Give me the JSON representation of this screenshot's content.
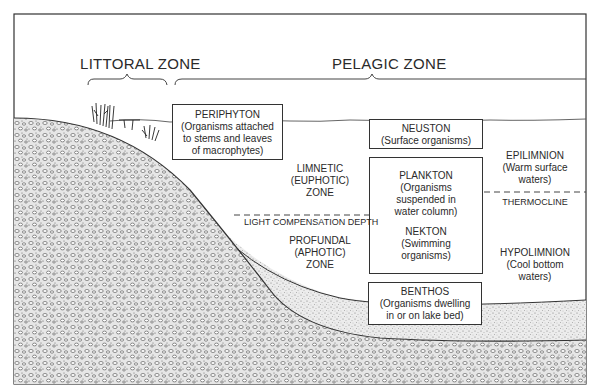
{
  "diagram": {
    "type": "lake zonation cross-section",
    "zones": {
      "littoral": "LITTORAL ZONE",
      "pelagic": "PELAGIC ZONE"
    },
    "boxes": {
      "periphyton": {
        "title": "PERIPHYTON",
        "lines": [
          "(Organisms attached",
          "to stems and leaves",
          "of macrophytes)"
        ]
      },
      "neuston": {
        "title": "NEUSTON",
        "lines": [
          "(Surface organisms)"
        ]
      },
      "plankton": {
        "title": "PLANKTON",
        "lines": [
          "(Organisms",
          "suspended in",
          "water column)"
        ]
      },
      "nekton": {
        "title": "NEKTON",
        "lines": [
          "(Swimming",
          "organisms)"
        ]
      },
      "benthos": {
        "title": "BENTHOS",
        "lines": [
          "(Organisms dwelling",
          "in or on lake bed)"
        ]
      }
    },
    "labels": {
      "limnetic": [
        "LIMNETIC",
        "(EUPHOTIC)",
        "ZONE"
      ],
      "light_compensation": "LIGHT COMPENSATION DEPTH",
      "profundal": [
        "PROFUNDAL",
        "(APHOTIC)",
        "ZONE"
      ],
      "epilimnion": [
        "EPILIMNION",
        "(Warm surface",
        "waters)"
      ],
      "thermocline": "THERMOCLINE",
      "hypolimnion": [
        "HYPOLIMNION",
        "(Cool bottom",
        "waters)"
      ]
    },
    "colors": {
      "line": "#333333",
      "sediment": "#d9d9d9",
      "rock": "#bdbdbd"
    }
  }
}
